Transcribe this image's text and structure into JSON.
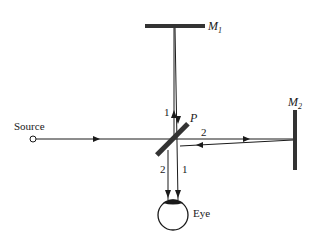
{
  "diagram": {
    "type": "Michelson interferometer",
    "labels": {
      "source": "Source",
      "mirror1": "M",
      "mirror1_sub": "1",
      "mirror2": "M",
      "mirror2_sub": "2",
      "splitter": "P",
      "eye": "Eye",
      "beam1_upper": "1",
      "beam2_right": "2",
      "beam2_lower": "2",
      "beam1_lower": "1"
    },
    "colors": {
      "line": "#1a1a1a",
      "mirror": "#333333",
      "background": "#ffffff"
    }
  }
}
